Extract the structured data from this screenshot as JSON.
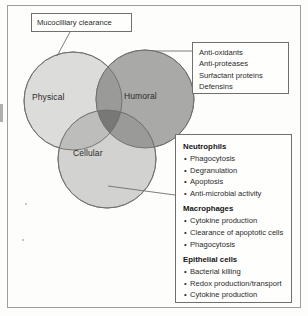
{
  "figure": {
    "type": "venn-diagram",
    "regions": [
      {
        "id": "physical",
        "label": "Physical",
        "fill": "#dcdcda"
      },
      {
        "id": "humoral",
        "label": "Humoral",
        "fill": "#a9a9a7"
      },
      {
        "id": "cellular",
        "label": "Cellular",
        "fill": "#d2d2d0"
      }
    ],
    "overlap_colors": {
      "physical_humoral": "#9a9a98",
      "humoral_cellular": "#9a9a98",
      "physical_cellular": "#bdbdbb",
      "triple": "#787876"
    },
    "stroke": "#6e6e6e"
  },
  "callouts": {
    "mucociliary": {
      "name": "Mucociliary clearance",
      "lines": [
        "Mucocilliary clearance"
      ],
      "target": "physical"
    },
    "humoral": {
      "name": "Humoral factors",
      "lines": [
        "Anti-oxidants",
        "Anti-proteases",
        "Surfactant proteins",
        "Defensins"
      ],
      "target": "humoral"
    },
    "cellular": {
      "name": "Cellular effectors",
      "target": "cellular",
      "groups": [
        {
          "heading": "Neutrophils",
          "items": [
            "Phagocytosis",
            "Degranulation",
            "Apoptosis",
            "Anti-microbial activity"
          ]
        },
        {
          "heading": "Macrophages",
          "items": [
            "Cytokine production",
            "Clearance of apoptotic cells",
            "Phagocytosis"
          ]
        },
        {
          "heading": "Epithelial cells",
          "items": [
            "Bacterial killing",
            "Redox production/transport",
            "Cytokine production"
          ]
        }
      ]
    }
  },
  "bullet_glyph": "•"
}
